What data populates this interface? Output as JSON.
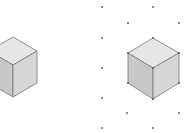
{
  "diagram": {
    "title": "",
    "colors": {
      "top": "#e6e6e6",
      "left": "#c8c8c8",
      "right": "#d6d6d6",
      "edge": "#777777",
      "dot": "#555555"
    },
    "left_cube": {
      "label": "plain cube"
    },
    "right_cube": {
      "label": "cube on isometric dot grid"
    },
    "grid_dots": [
      [
        102,
        7
      ],
      [
        153,
        7
      ],
      [
        128,
        23
      ],
      [
        179,
        23
      ],
      [
        102,
        38
      ],
      [
        102,
        68
      ],
      [
        102,
        98
      ],
      [
        127,
        113
      ],
      [
        179,
        113
      ],
      [
        102,
        128
      ],
      [
        153,
        128
      ]
    ]
  }
}
